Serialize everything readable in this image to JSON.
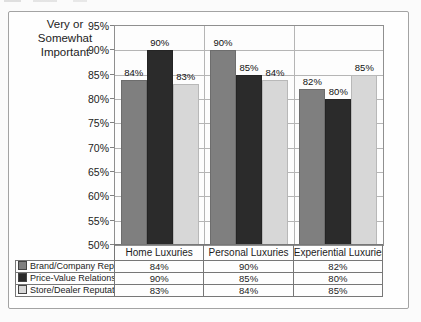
{
  "page": {
    "y_axis_title": "Very or\nSomewhat\nImportant"
  },
  "chart_data": {
    "type": "bar",
    "title": "",
    "y_axis_label": "Very or Somewhat Important",
    "categories": [
      "Home Luxuries",
      "Personal Luxuries",
      "Experiential Luxuries"
    ],
    "series": [
      {
        "name": "Brand/Company Reputation",
        "values": [
          84,
          90,
          82
        ],
        "color": "#7f7f7f"
      },
      {
        "name": "Price-Value Relationship",
        "values": [
          90,
          85,
          80
        ],
        "color": "#2b2b2b"
      },
      {
        "name": "Store/Dealer Reputation",
        "values": [
          83,
          84,
          85
        ],
        "color": "#d7d7d7"
      }
    ],
    "value_suffix": "%",
    "ylim": [
      50,
      95
    ],
    "ytick_step": 5,
    "ytick_labels": [
      "95%",
      "90%",
      "85%",
      "80%",
      "75%",
      "70%",
      "65%",
      "60%",
      "55%",
      "50%"
    ],
    "grid": true,
    "data_labels": true,
    "legend_position": "table-below"
  }
}
